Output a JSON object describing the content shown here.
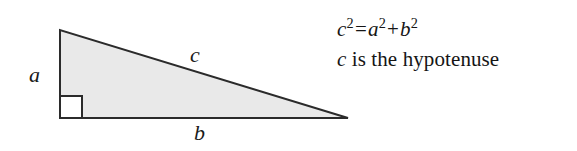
{
  "figure": {
    "name": "pythagorean-theorem-diagram",
    "background_color": "#ffffff",
    "width": 577,
    "height": 151
  },
  "triangle": {
    "shape": "right-triangle",
    "fill_color": "#e9e9e9",
    "stroke_color": "#2b2b2b",
    "stroke_width": 2,
    "vertices": {
      "top_left": [
        60,
        30
      ],
      "bottom_left": [
        60,
        118
      ],
      "bottom_right": [
        348,
        118
      ]
    },
    "right_angle_marker": {
      "corner": "bottom-left",
      "size": 22,
      "fill_color": "#ffffff",
      "stroke_color": "#2b2b2b"
    }
  },
  "labels": {
    "leg_a": "a",
    "leg_b": "b",
    "hypotenuse_c": "c"
  },
  "annotation": {
    "formula": {
      "lhs_variable": "c",
      "lhs_exponent": "2",
      "equals": "=",
      "term1_variable": "a",
      "term1_exponent": "2",
      "plus": "+",
      "term2_variable": "b",
      "term2_exponent": "2",
      "plain_text": "c2 = a2 + b2"
    },
    "description": {
      "variable": "c",
      "text": " is the hypotenuse",
      "plain_text": "c is the hypotenuse"
    }
  }
}
